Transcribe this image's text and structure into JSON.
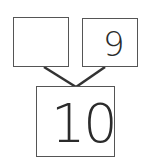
{
  "number_bond": {
    "part_left": {
      "value": ""
    },
    "part_right": {
      "value": "9"
    },
    "whole": {
      "value": "10"
    }
  },
  "colors": {
    "border": "#555555",
    "text": "#2b2b2b",
    "connector": "#333333",
    "background": "#ffffff"
  }
}
